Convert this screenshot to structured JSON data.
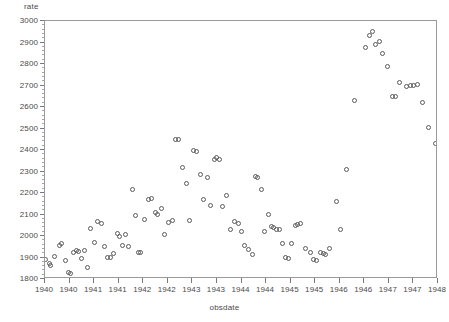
{
  "chart_data": {
    "type": "scatter",
    "title": "",
    "xlabel": "obsdate",
    "ylabel": "rate",
    "ylim": [
      1800,
      3000
    ],
    "ytick_values": [
      1800,
      1900,
      2000,
      2100,
      2200,
      2300,
      2400,
      2500,
      2600,
      2700,
      2800,
      2900,
      3000
    ],
    "ytick_labels": [
      "1800",
      "1900",
      "2000",
      "2100",
      "2200",
      "2300",
      "2400",
      "2500",
      "2600",
      "2700",
      "2800",
      "2900",
      "3000"
    ],
    "xlim": [
      1940.0,
      1948.0
    ],
    "xtick_values": [
      1940.0,
      1940.5,
      1941.0,
      1941.5,
      1942.0,
      1942.5,
      1943.0,
      1943.5,
      1944.0,
      1944.5,
      1945.0,
      1945.5,
      1946.0,
      1946.5,
      1947.0,
      1947.5,
      1948.0
    ],
    "xtick_labels": [
      "1940",
      "1940",
      "1941",
      "1941",
      "1942",
      "1942",
      "1943",
      "1943",
      "1944",
      "1944",
      "1945",
      "1945",
      "1946",
      "1946",
      "1947",
      "1947",
      "1948"
    ],
    "grid": false,
    "legend": false,
    "marker": "open-circle",
    "marker_color": "#5a5a5a",
    "points": [
      {
        "x": 1940.0,
        "y": 1893
      },
      {
        "x": 1940.09,
        "y": 1872
      },
      {
        "x": 1940.12,
        "y": 1865
      },
      {
        "x": 1940.2,
        "y": 1905
      },
      {
        "x": 1940.29,
        "y": 1957
      },
      {
        "x": 1940.33,
        "y": 1963
      },
      {
        "x": 1940.41,
        "y": 1884
      },
      {
        "x": 1940.47,
        "y": 1829
      },
      {
        "x": 1940.51,
        "y": 1826
      },
      {
        "x": 1940.58,
        "y": 1923
      },
      {
        "x": 1940.64,
        "y": 1932
      },
      {
        "x": 1940.68,
        "y": 1929
      },
      {
        "x": 1940.74,
        "y": 1897
      },
      {
        "x": 1940.8,
        "y": 1933
      },
      {
        "x": 1940.86,
        "y": 1854
      },
      {
        "x": 1940.92,
        "y": 2036
      },
      {
        "x": 1941.0,
        "y": 1972
      },
      {
        "x": 1941.07,
        "y": 2066
      },
      {
        "x": 1941.14,
        "y": 2060
      },
      {
        "x": 1941.21,
        "y": 1951
      },
      {
        "x": 1941.28,
        "y": 1902
      },
      {
        "x": 1941.33,
        "y": 1899
      },
      {
        "x": 1941.4,
        "y": 1918
      },
      {
        "x": 1941.47,
        "y": 2011
      },
      {
        "x": 1941.52,
        "y": 2000
      },
      {
        "x": 1941.57,
        "y": 1954
      },
      {
        "x": 1941.63,
        "y": 2009
      },
      {
        "x": 1941.7,
        "y": 1949
      },
      {
        "x": 1941.78,
        "y": 2218
      },
      {
        "x": 1941.85,
        "y": 2096
      },
      {
        "x": 1941.9,
        "y": 1925
      },
      {
        "x": 1941.95,
        "y": 1921
      },
      {
        "x": 1942.02,
        "y": 2077
      },
      {
        "x": 1942.1,
        "y": 2172
      },
      {
        "x": 1942.17,
        "y": 2176
      },
      {
        "x": 1942.24,
        "y": 2108
      },
      {
        "x": 1942.3,
        "y": 2101
      },
      {
        "x": 1942.37,
        "y": 2129
      },
      {
        "x": 1942.44,
        "y": 2006
      },
      {
        "x": 1942.52,
        "y": 2063
      },
      {
        "x": 1942.59,
        "y": 2071
      },
      {
        "x": 1942.66,
        "y": 2448
      },
      {
        "x": 1942.72,
        "y": 2450
      },
      {
        "x": 1942.8,
        "y": 2318
      },
      {
        "x": 1942.88,
        "y": 2246
      },
      {
        "x": 1942.95,
        "y": 2071
      },
      {
        "x": 1943.02,
        "y": 2399
      },
      {
        "x": 1943.09,
        "y": 2395
      },
      {
        "x": 1943.16,
        "y": 2284
      },
      {
        "x": 1943.22,
        "y": 2168
      },
      {
        "x": 1943.3,
        "y": 2272
      },
      {
        "x": 1943.37,
        "y": 2142
      },
      {
        "x": 1943.45,
        "y": 2354
      },
      {
        "x": 1943.5,
        "y": 2363
      },
      {
        "x": 1943.55,
        "y": 2358
      },
      {
        "x": 1943.62,
        "y": 2136
      },
      {
        "x": 1943.7,
        "y": 2187
      },
      {
        "x": 1943.78,
        "y": 2030
      },
      {
        "x": 1943.86,
        "y": 2068
      },
      {
        "x": 1943.93,
        "y": 2059
      },
      {
        "x": 1944.0,
        "y": 2022
      },
      {
        "x": 1944.07,
        "y": 1955
      },
      {
        "x": 1944.15,
        "y": 1936
      },
      {
        "x": 1944.22,
        "y": 1914
      },
      {
        "x": 1944.29,
        "y": 2276
      },
      {
        "x": 1944.33,
        "y": 2271
      },
      {
        "x": 1944.4,
        "y": 2215
      },
      {
        "x": 1944.47,
        "y": 2023
      },
      {
        "x": 1944.55,
        "y": 2102
      },
      {
        "x": 1944.61,
        "y": 2042
      },
      {
        "x": 1944.66,
        "y": 2038
      },
      {
        "x": 1944.72,
        "y": 2032
      },
      {
        "x": 1944.78,
        "y": 2030
      },
      {
        "x": 1944.84,
        "y": 1966
      },
      {
        "x": 1944.9,
        "y": 1899
      },
      {
        "x": 1944.95,
        "y": 1896
      },
      {
        "x": 1945.02,
        "y": 1965
      },
      {
        "x": 1945.1,
        "y": 2049
      },
      {
        "x": 1945.15,
        "y": 2054
      },
      {
        "x": 1945.2,
        "y": 2057
      },
      {
        "x": 1945.3,
        "y": 1942
      },
      {
        "x": 1945.4,
        "y": 1924
      },
      {
        "x": 1945.46,
        "y": 1890
      },
      {
        "x": 1945.52,
        "y": 1886
      },
      {
        "x": 1945.6,
        "y": 1921
      },
      {
        "x": 1945.66,
        "y": 1917
      },
      {
        "x": 1945.71,
        "y": 1915
      },
      {
        "x": 1945.8,
        "y": 1942
      },
      {
        "x": 1945.93,
        "y": 2161
      },
      {
        "x": 1946.02,
        "y": 2028
      },
      {
        "x": 1946.14,
        "y": 2308
      },
      {
        "x": 1946.3,
        "y": 2628
      },
      {
        "x": 1946.52,
        "y": 2878
      },
      {
        "x": 1946.6,
        "y": 2932
      },
      {
        "x": 1946.66,
        "y": 2952
      },
      {
        "x": 1946.72,
        "y": 2890
      },
      {
        "x": 1946.8,
        "y": 2905
      },
      {
        "x": 1946.88,
        "y": 2847
      },
      {
        "x": 1946.98,
        "y": 2790
      },
      {
        "x": 1947.08,
        "y": 2648
      },
      {
        "x": 1947.13,
        "y": 2651
      },
      {
        "x": 1947.22,
        "y": 2712
      },
      {
        "x": 1947.36,
        "y": 2694
      },
      {
        "x": 1947.44,
        "y": 2700
      },
      {
        "x": 1947.5,
        "y": 2702
      },
      {
        "x": 1947.58,
        "y": 2703
      },
      {
        "x": 1947.68,
        "y": 2619
      },
      {
        "x": 1947.8,
        "y": 2504
      },
      {
        "x": 1947.95,
        "y": 2428
      }
    ]
  }
}
